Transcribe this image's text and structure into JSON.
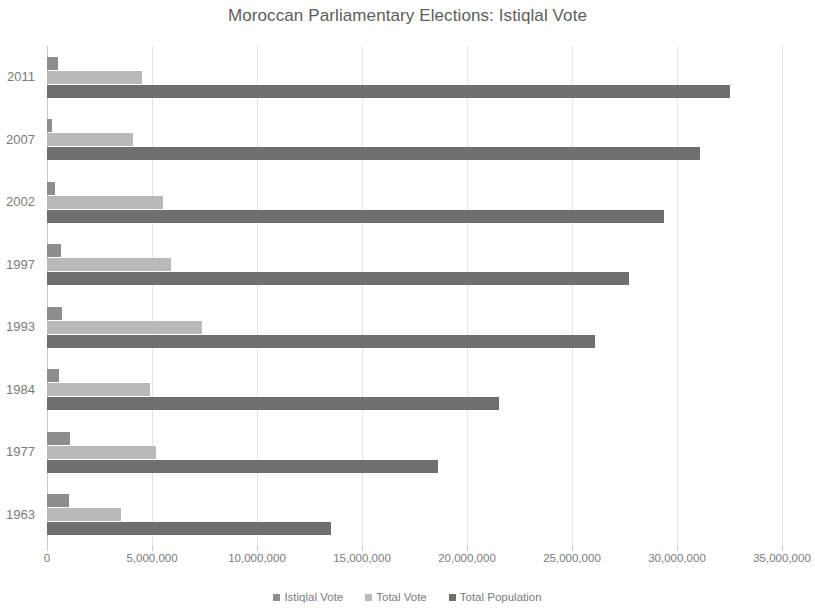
{
  "chart_data": {
    "type": "bar",
    "orientation": "horizontal",
    "title": "Moroccan Parliamentary Elections: Istiqlal Vote",
    "xlabel": "",
    "ylabel": "",
    "xlim": [
      0,
      35000000
    ],
    "xticks": [
      0,
      5000000,
      10000000,
      15000000,
      20000000,
      25000000,
      30000000,
      35000000
    ],
    "xtick_labels": [
      "0",
      "5,000,000",
      "10,000,000",
      "15,000,000",
      "20,000,000",
      "25,000,000",
      "30,000,000",
      "35,000,000"
    ],
    "categories": [
      "2011",
      "2007",
      "2002",
      "1997",
      "1993",
      "1984",
      "1977",
      "1963"
    ],
    "grid": true,
    "legend_position": "bottom",
    "series": [
      {
        "name": "Istiqlal Vote",
        "color": "#8d8d8d",
        "values": [
          500000,
          220000,
          400000,
          650000,
          720000,
          550000,
          1100000,
          1050000
        ]
      },
      {
        "name": "Total Vote",
        "color": "#b9b9b9",
        "values": [
          4500000,
          4100000,
          5500000,
          5900000,
          7400000,
          4900000,
          5200000,
          3500000
        ]
      },
      {
        "name": "Total Population",
        "color": "#6f6f6f",
        "values": [
          32500000,
          31100000,
          29400000,
          27700000,
          26100000,
          21500000,
          18600000,
          13500000
        ]
      }
    ]
  },
  "colors": {
    "istiqlal": "#8d8d8d",
    "total_vote": "#b9b9b9",
    "total_population": "#6f6f6f",
    "gridline": "#e2e2e2",
    "text": "#7a7a7a"
  }
}
